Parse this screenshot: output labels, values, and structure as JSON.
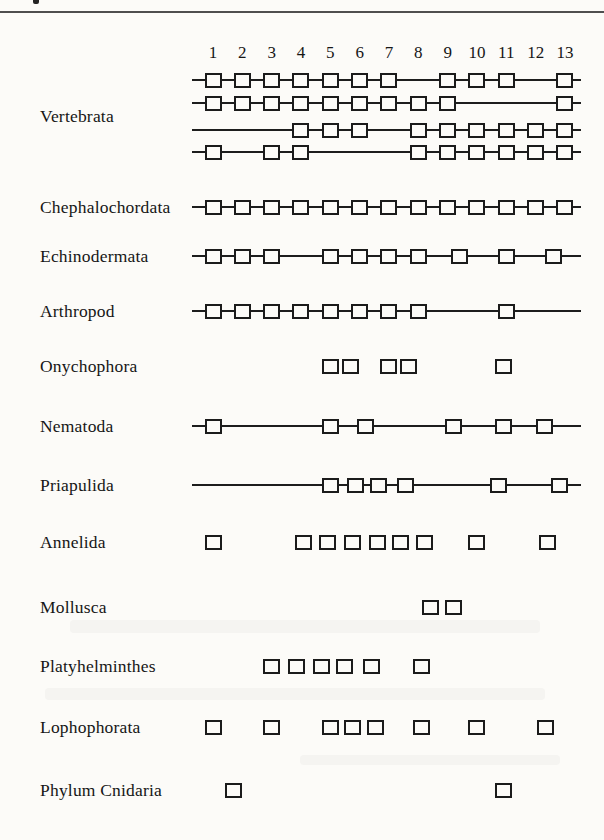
{
  "page": {
    "top_rule": true,
    "ink_speck": true
  },
  "chart_data": {
    "type": "table",
    "x_ticks": [
      "1",
      "2",
      "3",
      "4",
      "5",
      "6",
      "7",
      "8",
      "9",
      "10",
      "11",
      "12",
      "13"
    ],
    "x_range": [
      1,
      13
    ],
    "rows": [
      {
        "label": "Vertebrata",
        "tracks": [
          {
            "linked": true,
            "squares": [
              1,
              2,
              3,
              4,
              5,
              6,
              7,
              9,
              10,
              11,
              13
            ]
          },
          {
            "linked": true,
            "squares": [
              1,
              2,
              3,
              4,
              5,
              6,
              7,
              8,
              9,
              13
            ]
          },
          {
            "linked": true,
            "squares": [
              4,
              5,
              6,
              8,
              9,
              10,
              11,
              12,
              13
            ]
          },
          {
            "linked": true,
            "squares": [
              1,
              3,
              4,
              8,
              9,
              10,
              11,
              12,
              13
            ]
          }
        ]
      },
      {
        "label": "Chephalochordata",
        "tracks": [
          {
            "linked": true,
            "squares": [
              1,
              2,
              3,
              4,
              5,
              6,
              7,
              8,
              9,
              10,
              11,
              12,
              13
            ]
          }
        ]
      },
      {
        "label": "Echinodermata",
        "tracks": [
          {
            "linked": true,
            "squares": [
              1,
              2,
              3,
              5,
              6,
              7,
              8,
              9.4,
              11,
              12.6
            ]
          }
        ]
      },
      {
        "label": "Arthropod",
        "tracks": [
          {
            "linked": true,
            "squares": [
              1,
              2,
              3,
              4,
              5,
              6,
              7,
              8,
              11
            ]
          }
        ]
      },
      {
        "label": "Onychophora",
        "tracks": [
          {
            "linked": false,
            "squares": [
              5,
              5.7,
              7,
              7.65,
              10.9
            ]
          }
        ]
      },
      {
        "label": "Nematoda",
        "tracks": [
          {
            "linked": true,
            "squares": [
              1,
              5,
              6.2,
              9.2,
              10.9,
              12.3
            ]
          }
        ]
      },
      {
        "label": "Priapulida",
        "tracks": [
          {
            "linked": true,
            "squares": [
              5,
              5.85,
              6.65,
              7.55,
              10.75,
              12.8
            ]
          }
        ]
      },
      {
        "label": "Annelida",
        "tracks": [
          {
            "linked": false,
            "squares": [
              1,
              4.1,
              4.9,
              5.75,
              6.6,
              7.4,
              8.2,
              10,
              12.4
            ]
          }
        ]
      },
      {
        "label": "Mollusca",
        "tracks": [
          {
            "linked": false,
            "squares": [
              8.4,
              9.2
            ]
          }
        ]
      },
      {
        "label": "Platyhelminthes",
        "tracks": [
          {
            "linked": false,
            "squares": [
              3,
              3.85,
              4.7,
              5.5,
              6.4,
              8.1
            ]
          }
        ]
      },
      {
        "label": "Lophophorata",
        "tracks": [
          {
            "linked": false,
            "squares": [
              1,
              3,
              5,
              5.75,
              6.55,
              8.1,
              10,
              12.35
            ]
          }
        ]
      },
      {
        "label": "Phylum Cnidaria",
        "tracks": [
          {
            "linked": false,
            "squares": [
              1.7,
              10.9
            ]
          }
        ]
      }
    ]
  }
}
